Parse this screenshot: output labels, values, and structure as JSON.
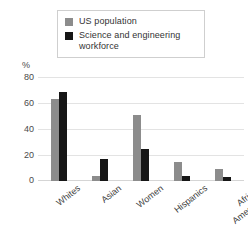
{
  "chart_data": {
    "type": "bar",
    "title": "",
    "xlabel": "",
    "ylabel": "%",
    "ylim": [
      0,
      80
    ],
    "yticks": [
      0,
      20,
      40,
      60,
      80
    ],
    "ytick_labels": [
      "0",
      "20",
      "40",
      "60",
      "80"
    ],
    "grid": true,
    "legend_position": "top-center",
    "categories": [
      "Whites",
      "Asian",
      "Women",
      "Hispanics",
      "African Americans"
    ],
    "series": [
      {
        "name": "US population",
        "color": "#8c8c8c",
        "values": [
          64,
          4,
          51,
          15,
          9.5
        ]
      },
      {
        "name": "Science and engineering workforce",
        "color": "#161616",
        "values": [
          69,
          17,
          24.5,
          4,
          3.5
        ]
      }
    ]
  },
  "legend": {
    "items": [
      {
        "label": "US population",
        "swatch": "legend-swatch-gray",
        "color": "#8c8c8c"
      },
      {
        "label": "Science and engineering workforce",
        "swatch": "legend-swatch-black",
        "color": "#161616"
      }
    ]
  },
  "axis": {
    "unit_label": "%",
    "y_ticks": [
      "80",
      "60",
      "40",
      "20",
      "0"
    ]
  },
  "x_labels": [
    "Whites",
    "Asian",
    "Women",
    "Hispanics",
    "African Americans"
  ]
}
